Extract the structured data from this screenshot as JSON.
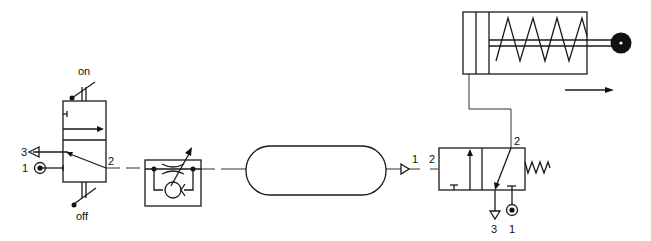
{
  "diagram": {
    "type": "pneumatic-circuit",
    "components": [
      {
        "id": "manual-valve",
        "kind": "3/2 manually operated detented valve",
        "labels": {
          "top": "on",
          "bottom": "off",
          "port_exhaust": "3",
          "port_supply": "1",
          "port_out": "2"
        }
      },
      {
        "id": "flow-control",
        "kind": "one-way flow control valve (throttle + check)"
      },
      {
        "id": "reservoir",
        "kind": "air reservoir / volume"
      },
      {
        "id": "pilot-valve",
        "kind": "3/2 pneumatically piloted spring-return valve",
        "labels": {
          "pilot_port": "1",
          "pilot_in": "2",
          "port_out": "2",
          "port_exhaust": "3",
          "port_supply": "1"
        }
      },
      {
        "id": "cylinder",
        "kind": "single-acting spring-return cylinder",
        "direction_arrow": "right"
      }
    ]
  },
  "labels": {
    "on": "on",
    "off": "off",
    "mv_port3": "3",
    "mv_port1": "1",
    "mv_port2": "2",
    "pv_pilot1": "1",
    "pv_pilot2": "2",
    "pv_port2": "2",
    "pv_port3": "3",
    "pv_port1": "1"
  },
  "colors": {
    "line": "#1a1a1a",
    "background": "#ffffff"
  }
}
